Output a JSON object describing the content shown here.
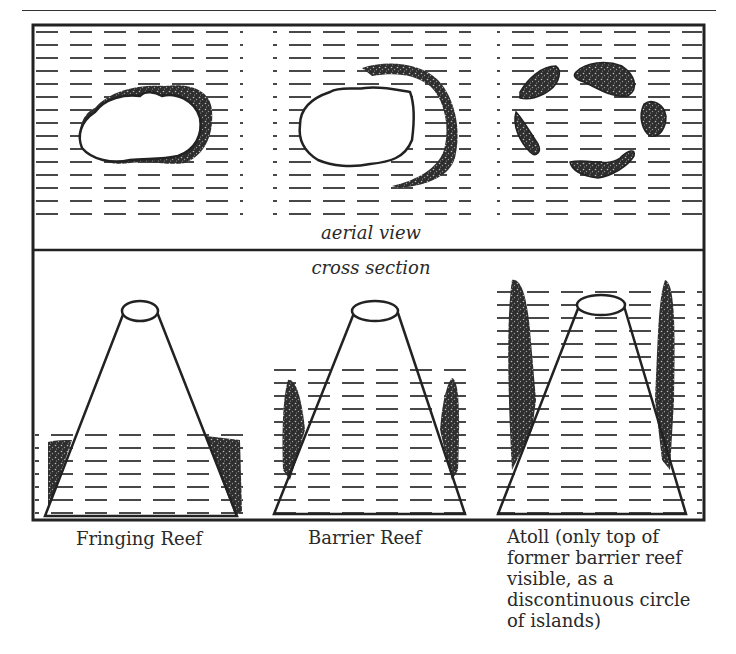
{
  "figure": {
    "section_labels": {
      "aerial": "aerial view",
      "cross": "cross section"
    },
    "panels": [
      {
        "id": "fringing",
        "caption": "Fringing Reef"
      },
      {
        "id": "barrier",
        "caption": "Barrier Reef"
      },
      {
        "id": "atoll",
        "caption_lines": [
          "Atoll (only top of",
          "former barrier reef",
          "visible, as a",
          "discontinuous circle",
          "of islands)"
        ]
      }
    ],
    "colors": {
      "ink": "#222222",
      "reef_fill": "#333333",
      "paper": "#ffffff"
    }
  }
}
